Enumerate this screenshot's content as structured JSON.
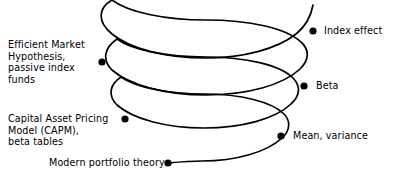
{
  "diagram": {
    "type": "spiral-timeline",
    "title": "",
    "stroke_color": "#000000",
    "background_color": "#ffffff",
    "node_color": "#000000",
    "nodes": [
      {
        "id": "index-effect",
        "label": "Index effect",
        "side": "right",
        "dot": {
          "x": 313,
          "y": 31
        },
        "text": {
          "x": 324,
          "y": 25
        }
      },
      {
        "id": "efficient-market-hypothesis",
        "label": "Efficient Market\nHypothesis,\npassive index\nfunds",
        "side": "left",
        "dot": {
          "x": 102,
          "y": 62
        },
        "text": {
          "x": 8,
          "y": 39
        }
      },
      {
        "id": "beta",
        "label": "Beta",
        "side": "right",
        "dot": {
          "x": 304,
          "y": 86
        },
        "text": {
          "x": 316,
          "y": 80
        }
      },
      {
        "id": "capital-asset-pricing-model",
        "label": "Capital Asset Pricing\nModel (CAPM),\nbeta tables",
        "side": "left",
        "dot": {
          "x": 125,
          "y": 119
        },
        "text": {
          "x": 8,
          "y": 113
        }
      },
      {
        "id": "mean-variance",
        "label": "Mean, variance",
        "side": "right",
        "dot": {
          "x": 281,
          "y": 136
        },
        "text": {
          "x": 293,
          "y": 130
        }
      },
      {
        "id": "modern-portfolio-theory",
        "label": "Modern portfolio theory",
        "side": "left",
        "dot": {
          "x": 168,
          "y": 163
        },
        "text": {
          "x": 49,
          "y": 157
        }
      }
    ]
  }
}
